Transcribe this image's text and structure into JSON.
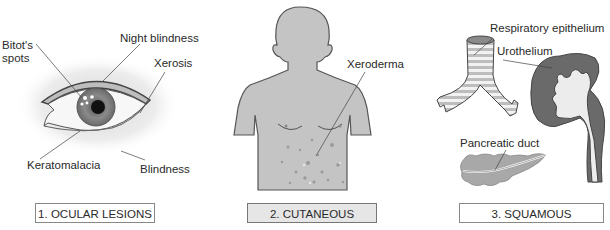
{
  "panels": [
    {
      "caption": "1. OCULAR LESIONS",
      "labels": {
        "bitots_spots_line1": "Bitot's",
        "bitots_spots_line2": "spots",
        "night_blindness": "Night blindness",
        "xerosis": "Xerosis",
        "keratomalacia": "Keratomalacia",
        "blindness": "Blindness"
      }
    },
    {
      "caption": "2. CUTANEOUS LESIONS",
      "labels": {
        "xeroderma": "Xeroderma"
      }
    },
    {
      "caption": "3. SQUAMOUS METAPLASIA",
      "labels": {
        "respiratory_epithelium": "Respiratory epithelium",
        "urothelium": "Urothelium",
        "pancreatic_duct": "Pancreatic duct"
      }
    }
  ],
  "colors": {
    "skin": "#c4c4c4",
    "outline": "#555555",
    "kidney_cortex": "#6a6a6a",
    "caption_highlight": "#e6e6e6"
  }
}
